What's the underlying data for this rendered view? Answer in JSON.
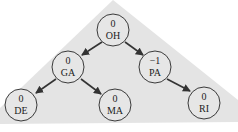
{
  "diagram": {
    "type": "avl-tree",
    "background_color": "#e4e4e4",
    "nodes": [
      {
        "id": "OH",
        "label": "OH",
        "balance": "0",
        "x": 113,
        "y": 30
      },
      {
        "id": "GA",
        "label": "GA",
        "balance": "0",
        "x": 68,
        "y": 67
      },
      {
        "id": "PA",
        "label": "PA",
        "balance": "−1",
        "x": 155,
        "y": 67
      },
      {
        "id": "DE",
        "label": "DE",
        "balance": "0",
        "x": 21,
        "y": 105
      },
      {
        "id": "MA",
        "label": "MA",
        "balance": "0",
        "x": 115,
        "y": 105
      },
      {
        "id": "RI",
        "label": "RI",
        "balance": "0",
        "x": 204,
        "y": 103
      }
    ],
    "edges": [
      {
        "from": "OH",
        "to": "GA"
      },
      {
        "from": "OH",
        "to": "PA"
      },
      {
        "from": "GA",
        "to": "DE"
      },
      {
        "from": "GA",
        "to": "MA"
      },
      {
        "from": "PA",
        "to": "RI"
      }
    ]
  }
}
